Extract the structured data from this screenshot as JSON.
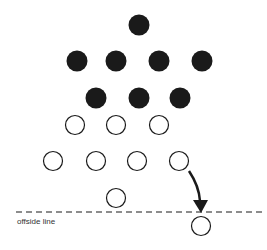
{
  "diagram": {
    "colors": {
      "filled": "#1a1a1a",
      "open_stroke": "#1a1a1a",
      "background": "#ffffff"
    },
    "filled_players": [
      {
        "x": 139,
        "y": 25
      },
      {
        "x": 77,
        "y": 61
      },
      {
        "x": 116,
        "y": 61
      },
      {
        "x": 159,
        "y": 61
      },
      {
        "x": 202,
        "y": 61
      },
      {
        "x": 96,
        "y": 98
      },
      {
        "x": 139,
        "y": 98
      },
      {
        "x": 180,
        "y": 98
      }
    ],
    "open_players": [
      {
        "x": 75,
        "y": 125
      },
      {
        "x": 116,
        "y": 125
      },
      {
        "x": 159,
        "y": 125
      },
      {
        "x": 53,
        "y": 161
      },
      {
        "x": 96,
        "y": 161
      },
      {
        "x": 137,
        "y": 161
      },
      {
        "x": 179,
        "y": 161
      },
      {
        "x": 116,
        "y": 198
      },
      {
        "x": 201,
        "y": 226
      }
    ],
    "offside_line": {
      "label": "offside line",
      "y": 212
    }
  }
}
